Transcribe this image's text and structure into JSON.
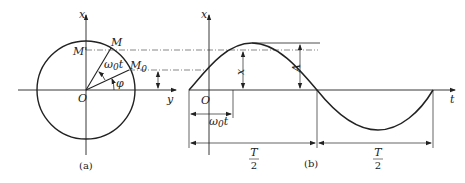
{
  "figure_a": {
    "caption": "(a)",
    "axis_x_label": "x",
    "axis_y_label": "y",
    "origin_label": "O",
    "point_M": "M",
    "point_M_prime": "M'",
    "point_M0": "M",
    "point_M0_sub": "0",
    "angle_wt": "ω",
    "angle_wt_sub": "0",
    "angle_wt_t": "t",
    "angle_phi": "φ"
  },
  "figure_b": {
    "caption": "(b)",
    "axis_x_label": "x",
    "axis_t_label": "t",
    "origin_label": "O",
    "displacement_label": "x",
    "amplitude_label": "A",
    "phase_time_label": "ω",
    "phase_time_sub": "0",
    "phase_time_t": "t",
    "half_period_1_num": "T",
    "half_period_1_den": "2",
    "half_period_2_num": "T",
    "half_period_2_den": "2"
  },
  "colors": {
    "line": "#222222",
    "background": "#ffffff"
  }
}
